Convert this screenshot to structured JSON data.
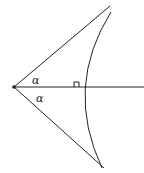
{
  "diagram": {
    "type": "geometry",
    "colors": {
      "stroke": "#222222",
      "background": "#ffffff"
    },
    "labels": {
      "upper_angle": "α",
      "lower_angle": "α"
    },
    "elements": [
      "vertex-point",
      "upper-ray",
      "lower-ray",
      "horizontal-axis",
      "concave-curve",
      "right-angle-marker"
    ]
  }
}
